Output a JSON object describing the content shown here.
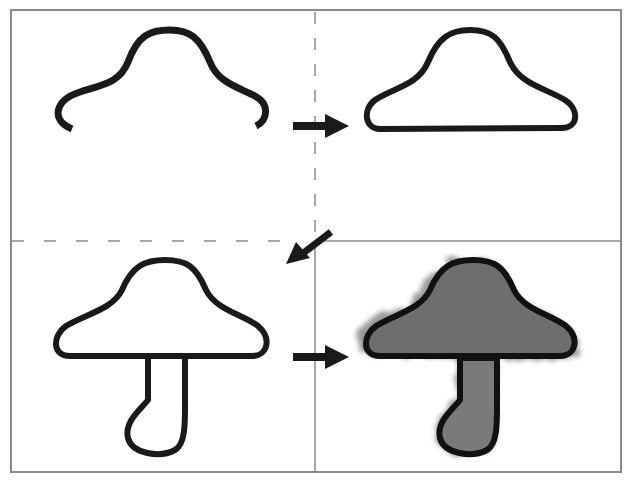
{
  "diagram": {
    "steps": [
      {
        "step": 1,
        "description": "Cap top outline (open curve)"
      },
      {
        "step": 2,
        "description": "Closed cap outline"
      },
      {
        "step": 3,
        "description": "Cap with stem outline"
      },
      {
        "step": 4,
        "description": "Shaded mushroom"
      }
    ],
    "colors": {
      "stroke": "#111111",
      "fill_shade": "#6e6e6e",
      "frame": "#8a8a8a"
    }
  }
}
